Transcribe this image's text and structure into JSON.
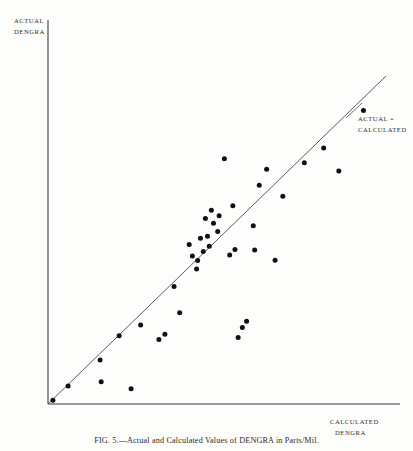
{
  "figure": {
    "caption": "FIG. 5.—Actual and Calculated Values of DENGRA in Parts/Mil.",
    "background_color": "#fdfdfc",
    "ink_color": "#101010"
  },
  "axes": {
    "y_label_line1": "ACTUAL",
    "y_label_line2": "DENGRA",
    "x_label_line1": "CALCULATED",
    "x_label_line2": "DENGRA",
    "axis_color": "#3b3b3b"
  },
  "annotations": {
    "diagonal_line1": "ACTUAL  =",
    "diagonal_line2": "CALCULATED"
  },
  "chart_data": {
    "type": "scatter",
    "title": "FIG. 5.—Actual and Calculated Values of DENGRA in Parts/Mil.",
    "xlabel": "CALCULATED DENGRA",
    "ylabel": "ACTUAL DENGRA",
    "grid": false,
    "legend": null,
    "xlim": [
      0,
      100
    ],
    "ylim": [
      0,
      100
    ],
    "reference_line": {
      "label": "ACTUAL = CALCULATED",
      "slope": 1,
      "intercept": 0,
      "x_from": 0,
      "x_to": 96,
      "y_from": 0,
      "y_to": 96
    },
    "x": [
      1.4,
      5.7,
      14.8,
      15.1,
      20.2,
      23.6,
      26.3,
      31.5,
      33.2,
      35.8,
      37.4,
      40.1,
      41.0,
      42.2,
      42.5,
      43.3,
      44.1,
      44.7,
      45.3,
      45.8,
      46.4,
      47.0,
      48.2,
      48.6,
      50.1,
      51.6,
      52.5,
      53.1,
      54.0,
      55.2,
      56.4,
      58.3,
      58.7,
      60.0,
      62.1,
      64.5,
      66.7,
      72.8,
      78.3,
      82.6,
      89.6
    ],
    "y": [
      1.1,
      5.3,
      12.9,
      6.5,
      20.0,
      4.5,
      23.1,
      18.9,
      20.4,
      34.4,
      26.7,
      46.7,
      43.3,
      39.5,
      42.0,
      48.5,
      44.6,
      54.3,
      49.1,
      46.2,
      56.7,
      52.9,
      50.5,
      55.1,
      71.8,
      43.6,
      58.0,
      45.2,
      19.5,
      22.4,
      24.2,
      52.2,
      45.1,
      64.0,
      68.7,
      42.1,
      60.8,
      70.6,
      74.9,
      68.2,
      85.9
    ],
    "n_points": 41,
    "marker": "filled-circle",
    "marker_color": "#101010"
  },
  "geometry": {
    "origin_px": {
      "x": 48,
      "y": 404
    },
    "x_axis_end_px": {
      "x": 400,
      "y": 404
    },
    "y_axis_top_px": {
      "x": 48,
      "y": 20
    },
    "ref_line_end_px": {
      "x": 386,
      "y": 76
    }
  }
}
